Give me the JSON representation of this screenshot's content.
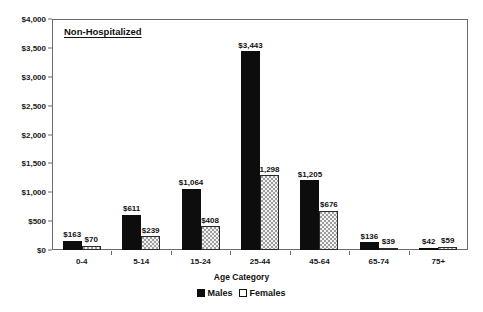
{
  "chart_data": {
    "type": "bar",
    "title": "Non-Hospitalized",
    "xlabel": "Age Category",
    "ylabel": "",
    "categories": [
      "0-4",
      "5-14",
      "15-24",
      "25-44",
      "45-64",
      "65-74",
      "75+"
    ],
    "series": [
      {
        "name": "Males",
        "values": [
          163,
          611,
          1064,
          3443,
          1205,
          136,
          42
        ],
        "labels": [
          "$163",
          "$611",
          "$1,064",
          "$3,443",
          "$1,205",
          "$136",
          "$42"
        ],
        "color": "#0d0d0d",
        "fill": "solid-black"
      },
      {
        "name": "Females",
        "values": [
          70,
          239,
          408,
          1298,
          676,
          39,
          59
        ],
        "labels": [
          "$70",
          "$239",
          "$408",
          "1,298",
          "$676",
          "$39",
          "$59"
        ],
        "color": "#ffffff",
        "fill": "dotted-white"
      }
    ],
    "ylim": [
      0,
      4000
    ],
    "yticks": [
      0,
      500,
      1000,
      1500,
      2000,
      2500,
      3000,
      3500,
      4000
    ],
    "ytick_labels": [
      "$0",
      "$500",
      "$1,000",
      "$1,500",
      "$2,000",
      "$2,500",
      "$3,000",
      "$3,500",
      "$4,000"
    ],
    "grid": false,
    "legend_position": "bottom",
    "legend_entries": [
      "Males",
      "Females"
    ]
  }
}
